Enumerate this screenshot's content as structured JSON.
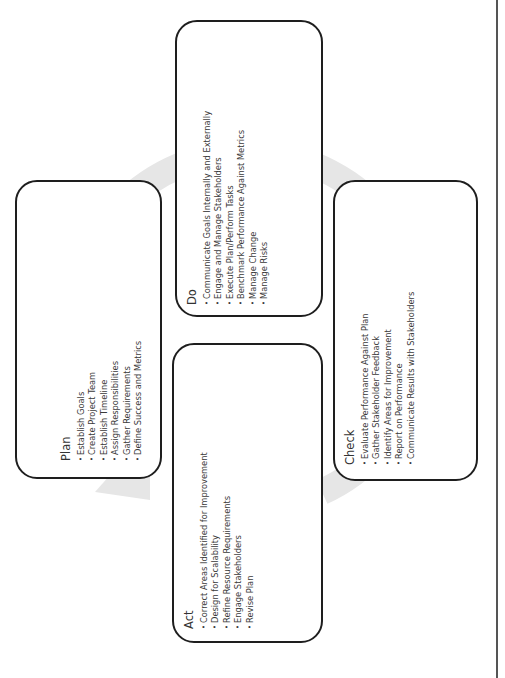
{
  "diagram": {
    "type": "PDCA cycle",
    "orientation": "rotated 90 degrees counter-clockwise",
    "colors": {
      "box_border": "#1e1e1e",
      "cycle_arrow": "#e6e6e6",
      "text": "#3a3a3a",
      "right_rule": "#555555"
    },
    "bullet_char": "•",
    "stages": [
      {
        "id": "plan",
        "title": "Plan",
        "items": [
          "Establish  Goals",
          "Create Project Team",
          "Establish Timeline",
          "Assign Responsibilities",
          "Gather Requirements",
          "Define Success and Metrics"
        ]
      },
      {
        "id": "do",
        "title": "Do",
        "items": [
          "Communicate Goals Internally and Externally",
          "Engage and Manage  Stakeholders",
          "Execute Plan/Perform Tasks",
          "Benchmark Performance Against Metrics",
          "Manage Change",
          "Manage Risks"
        ]
      },
      {
        "id": "check",
        "title": "Check",
        "items": [
          "Evaluate Performance Against Plan",
          "Gather Stakeholder Feedback",
          "Identify Areas for Improvement",
          "Report on Performance",
          "Communicate Results with Stakeholders"
        ]
      },
      {
        "id": "act",
        "title": "Act",
        "items": [
          "Correct Areas Identified for Improvement",
          "Design for Scalability",
          "Refine Resource Requirements",
          "Engage Stakeholders",
          "Revise Plan"
        ]
      }
    ]
  }
}
